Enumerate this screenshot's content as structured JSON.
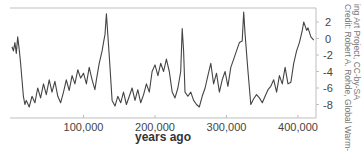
{
  "chart_data": {
    "type": "line",
    "title": "",
    "xlabel": "years ago",
    "ylabel": "",
    "credit": [
      "Credit: Robert A. Rohde, Global Warm-",
      "ing Art Project, CC-by-SA"
    ],
    "xlim": [
      0,
      425000
    ],
    "ylim": [
      -9.5,
      3.5
    ],
    "x_ticks": [
      100000,
      200000,
      300000,
      400000
    ],
    "x_tick_labels": [
      "100,000",
      "200,000",
      "300,000",
      "400,000"
    ],
    "y_ticks": [
      2,
      0,
      -2,
      -4,
      -6,
      -8
    ],
    "y_tick_labels": [
      "2",
      "0",
      "-2",
      "-4",
      "-6",
      "-8"
    ],
    "y_axis_position": "right",
    "grid": false,
    "line_color": "#444444",
    "series": [
      {
        "name": "temperature anomaly",
        "x": [
          0,
          2000,
          4000,
          6000,
          8000,
          10000,
          12000,
          14000,
          16000,
          18000,
          20000,
          24000,
          28000,
          32000,
          36000,
          40000,
          44000,
          48000,
          52000,
          56000,
          60000,
          64000,
          68000,
          72000,
          76000,
          80000,
          84000,
          88000,
          92000,
          96000,
          100000,
          104000,
          108000,
          112000,
          116000,
          118000,
          122000,
          126000,
          128000,
          130000,
          132000,
          136000,
          140000,
          144000,
          148000,
          152000,
          156000,
          160000,
          164000,
          168000,
          172000,
          176000,
          180000,
          184000,
          188000,
          192000,
          196000,
          200000,
          204000,
          208000,
          212000,
          216000,
          220000,
          224000,
          228000,
          232000,
          236000,
          238000,
          240000,
          242000,
          246000,
          250000,
          254000,
          258000,
          262000,
          266000,
          270000,
          274000,
          278000,
          282000,
          286000,
          290000,
          294000,
          298000,
          302000,
          306000,
          310000,
          314000,
          318000,
          322000,
          324000,
          326000,
          330000,
          334000,
          338000,
          342000,
          346000,
          350000,
          354000,
          358000,
          362000,
          366000,
          370000,
          374000,
          378000,
          382000,
          386000,
          390000,
          394000,
          398000,
          402000,
          406000,
          408000,
          410000,
          412000,
          414000,
          418000,
          422000
        ],
        "values": [
          -1.0,
          -1.5,
          -0.5,
          -1.8,
          0.2,
          -1.2,
          -3.0,
          -5.0,
          -7.0,
          -8.0,
          -7.5,
          -8.3,
          -7.0,
          -7.8,
          -6.0,
          -7.2,
          -5.5,
          -6.8,
          -5.0,
          -6.5,
          -5.2,
          -7.0,
          -7.8,
          -6.5,
          -5.0,
          -6.3,
          -4.5,
          -5.5,
          -3.8,
          -4.8,
          -4.2,
          -5.5,
          -3.5,
          -5.0,
          -6.2,
          -5.0,
          -3.0,
          -1.5,
          -0.5,
          0.5,
          3.0,
          -2.0,
          -7.5,
          -8.2,
          -7.0,
          -7.8,
          -6.5,
          -8.0,
          -7.0,
          -6.0,
          -7.5,
          -6.2,
          -7.8,
          -6.8,
          -5.5,
          -6.5,
          -4.0,
          -3.2,
          -4.5,
          -3.0,
          -4.0,
          -2.5,
          -4.0,
          -6.5,
          -7.2,
          -6.0,
          -4.0,
          1.2,
          -1.5,
          -6.5,
          -7.0,
          -6.5,
          -7.5,
          -8.0,
          -8.3,
          -7.0,
          -6.0,
          -4.5,
          -3.0,
          -5.5,
          -4.2,
          -6.5,
          -5.0,
          -4.0,
          -5.8,
          -3.5,
          -2.5,
          -1.5,
          -0.5,
          -0.3,
          3.2,
          0.5,
          -4.0,
          -8.0,
          -7.3,
          -6.8,
          -7.2,
          -7.8,
          -7.0,
          -6.2,
          -5.8,
          -5.0,
          -6.5,
          -4.5,
          -5.5,
          -3.5,
          -5.5,
          -5.3,
          -3.0,
          -1.5,
          -0.5,
          1.0,
          2.0,
          1.5,
          1.0,
          1.3,
          0.2,
          -0.2
        ]
      }
    ]
  }
}
